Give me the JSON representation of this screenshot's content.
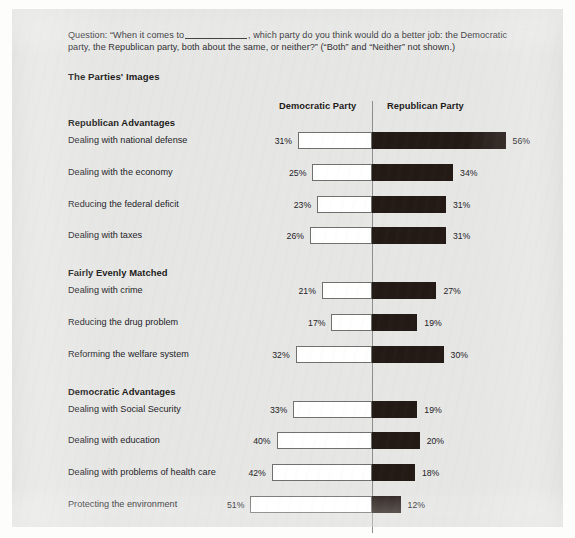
{
  "question": {
    "prefix": "Question: “When it comes to",
    "blank": "__________",
    "suffix": ", which party do you think would do a better job: the Democratic party, the Republican party, both about the same, or neither?” (“Both” and “Neither” not shown.)"
  },
  "chart_title": "The Parties' Images",
  "columns": {
    "democratic": "Democratic Party",
    "republican": "Republican Party"
  },
  "colors": {
    "republican_bar": "#231915",
    "democratic_bar": "#ffffff",
    "bar_outline": "#6f716e",
    "axis": "#8d8f8c",
    "paper": "#e6e7e5",
    "text": "#23211f"
  },
  "chart_data": {
    "type": "bar",
    "title": "The Parties' Images",
    "subtype": "diverging-horizontal",
    "xlabel": "",
    "ylabel": "",
    "grid": false,
    "legend_position": "top",
    "axis_center_value": 0,
    "series": [
      {
        "name": "Democratic Party",
        "direction": "left",
        "color": "#ffffff"
      },
      {
        "name": "Republican Party",
        "direction": "right",
        "color": "#231915"
      }
    ],
    "groups": [
      {
        "heading": "Republican Advantages",
        "rows": [
          {
            "label": "Dealing with national defense",
            "democratic": 31,
            "republican": 56,
            "democratic_label": "31%",
            "republican_label": "56%"
          },
          {
            "label": "Dealing with the economy",
            "democratic": 25,
            "republican": 34,
            "democratic_label": "25%",
            "republican_label": "34%"
          },
          {
            "label": "Reducing the federal deficit",
            "democratic": 23,
            "republican": 31,
            "democratic_label": "23%",
            "republican_label": "31%"
          },
          {
            "label": "Dealing with taxes",
            "democratic": 26,
            "republican": 31,
            "democratic_label": "26%",
            "republican_label": "31%"
          }
        ]
      },
      {
        "heading": "Fairly Evenly Matched",
        "rows": [
          {
            "label": "Dealing with crime",
            "democratic": 21,
            "republican": 27,
            "democratic_label": "21%",
            "republican_label": "27%"
          },
          {
            "label": "Reducing the drug problem",
            "democratic": 17,
            "republican": 19,
            "democratic_label": "17%",
            "republican_label": "19%"
          },
          {
            "label": "Reforming the welfare system",
            "democratic": 32,
            "republican": 30,
            "democratic_label": "32%",
            "republican_label": "30%"
          }
        ]
      },
      {
        "heading": "Democratic Advantages",
        "rows": [
          {
            "label": "Dealing with Social Security",
            "democratic": 33,
            "republican": 19,
            "democratic_label": "33%",
            "republican_label": "19%"
          },
          {
            "label": "Dealing with education",
            "democratic": 40,
            "republican": 20,
            "democratic_label": "40%",
            "republican_label": "20%"
          },
          {
            "label": "Dealing with problems of health care",
            "democratic": 42,
            "republican": 18,
            "democratic_label": "42%",
            "republican_label": "18%"
          },
          {
            "label": "Protecting the environment",
            "democratic": 51,
            "republican": 12,
            "democratic_label": "51%",
            "republican_label": "12%"
          }
        ]
      }
    ]
  }
}
